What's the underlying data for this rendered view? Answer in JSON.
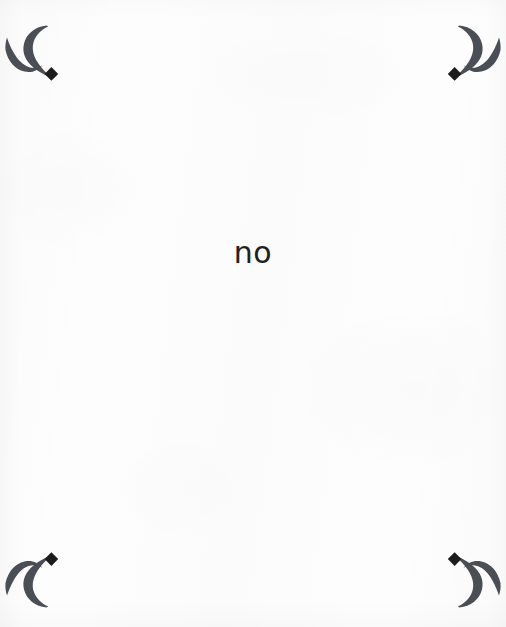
{
  "page": {
    "width": 506,
    "height": 627,
    "background_color": "#fdfdfd",
    "kind": "scanned-book-page"
  },
  "body": {
    "center_word": "no",
    "text_color": "#231f20"
  },
  "ornaments": {
    "icon_name": "corner-flourish-ornament",
    "color": "#4a4f56",
    "accent_color": "#1c1c1c",
    "count": 4,
    "corners": [
      {
        "position": "top-left",
        "name": "ornament-top-left",
        "transform": "none"
      },
      {
        "position": "top-right",
        "name": "ornament-top-right",
        "transform": "mirror-horizontal"
      },
      {
        "position": "bottom-left",
        "name": "ornament-bottom-left",
        "transform": "mirror-vertical"
      },
      {
        "position": "bottom-right",
        "name": "ornament-bottom-right",
        "transform": "rotate-180"
      }
    ]
  }
}
